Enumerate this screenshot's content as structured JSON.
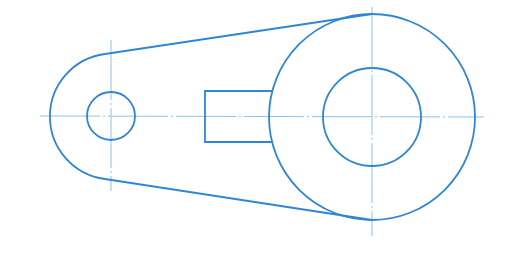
{
  "drawing": {
    "type": "mechanical link / crank arm (orthographic view)",
    "colors": {
      "outline": "#2f86d4",
      "centerline": "#8ec3ee",
      "background": "#ffffff"
    },
    "left_boss": {
      "cx": 111,
      "cy": 116,
      "outer_r": 63,
      "hole_r": 24
    },
    "right_boss": {
      "cx": 372,
      "cy": 117,
      "outer_r": 103,
      "hole_r": 49
    },
    "web_rectangle": {
      "x": 205,
      "y": 91,
      "w": 67,
      "h": 51
    },
    "tangent_lines": [
      {
        "x1": 105,
        "y1": 54,
        "x2": 372,
        "y2": 14
      },
      {
        "x1": 105,
        "y1": 179,
        "x2": 372,
        "y2": 220
      }
    ],
    "centerlines": [
      {
        "x1": 40,
        "y1": 116,
        "x2": 484,
        "y2": 117
      },
      {
        "x1": 111,
        "y1": 40,
        "x2": 111,
        "y2": 191
      },
      {
        "x1": 372,
        "y1": 7,
        "x2": 372,
        "y2": 236
      }
    ]
  }
}
